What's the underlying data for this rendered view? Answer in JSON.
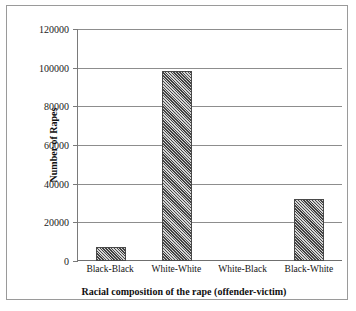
{
  "chart_data": {
    "type": "bar",
    "title": "",
    "xlabel": "Racial composition of the rape (offender-victim)",
    "ylabel": "Number of Rapes",
    "categories": [
      "Black-Black",
      "White-White",
      "White-Black",
      "Black-White"
    ],
    "values": [
      7200,
      98500,
      0,
      31900
    ],
    "ylim": [
      0,
      120000
    ],
    "yticks": [
      0,
      20000,
      40000,
      60000,
      80000,
      100000,
      120000
    ],
    "ytick_labels": [
      "0",
      "20000",
      "40000",
      "60000",
      "80000",
      "100000",
      "120000"
    ],
    "grid": true,
    "grid_axis": "y",
    "legend": false,
    "bar_fill": "#8a8a8a",
    "bar_pattern": "diagonal-hatch",
    "bar_edge_color": "#4a4a4a",
    "gridline_color": "#8d8d8d",
    "background": "#ffffff",
    "frame_border_color": "#9a9a9a"
  }
}
